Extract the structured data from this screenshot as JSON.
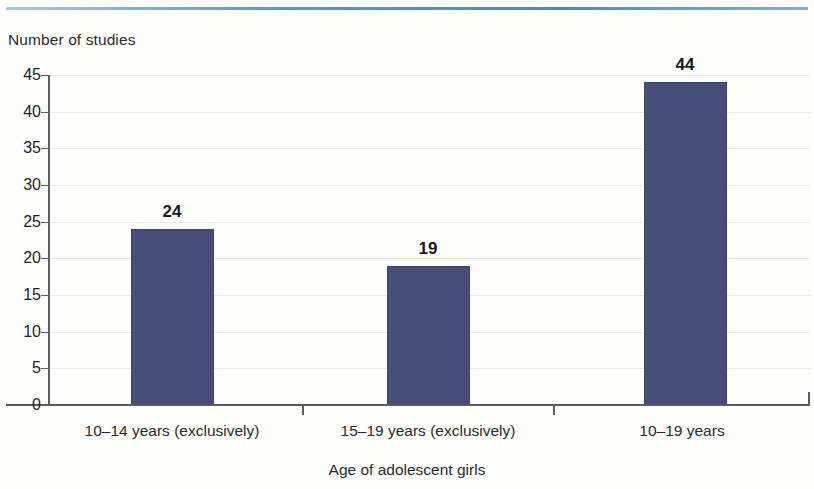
{
  "decor": {
    "top_rule_color": "#5b92c9"
  },
  "chart_data": {
    "type": "bar",
    "title": "",
    "subtitle": "",
    "ylabel": "Number of studies",
    "xlabel": "Age of adolescent girls",
    "categories": [
      "10–14 years (exclusively)",
      "15–19 years (exclusively)",
      "10–19 years"
    ],
    "values": [
      24,
      19,
      44
    ],
    "value_labels": [
      "24",
      "19",
      "44"
    ],
    "ylim": [
      0,
      45
    ],
    "ytick_labels": [
      "0",
      "5",
      "10",
      "15",
      "20",
      "25",
      "30",
      "35",
      "40",
      "45"
    ],
    "ytick_values": [
      0,
      5,
      10,
      15,
      20,
      25,
      30,
      35,
      40,
      45
    ],
    "grid": "horizontal",
    "legend": "none",
    "bar_color": "#454e77",
    "grid_color": "#e9e9e9",
    "axis_color": "#5d5d5d",
    "background_color": "#fdfdfb"
  }
}
